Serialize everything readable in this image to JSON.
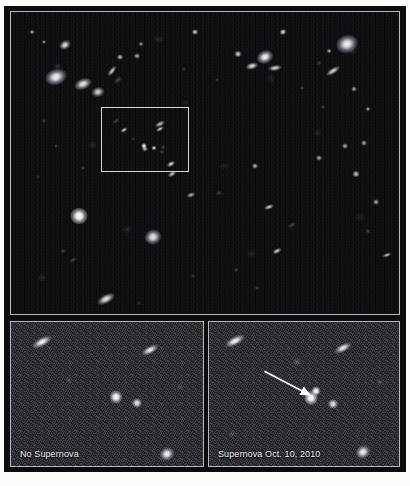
{
  "figure": {
    "kind": "astronomical-image-plate",
    "background_color": "#fbfbf9",
    "frame_color": "#0c0c0e",
    "panel_border_color": "#b9b9b4",
    "sky_color": "#0a0a0c",
    "zoom_sky_color": "#1b1b20",
    "star_color": "#ffffff"
  },
  "panels": {
    "wide_field": {
      "name": "wide-field-deep-sky-image",
      "caption": "",
      "roi_box": {
        "x": 97,
        "y": 107,
        "width": 88,
        "height": 65,
        "color": "#d8d8d2"
      }
    },
    "before": {
      "name": "before-cutout",
      "caption": "No Supernova"
    },
    "after": {
      "name": "after-cutout",
      "caption": "Supernova Oct. 10, 2010",
      "arrow": {
        "name": "supernova-pointer-arrow",
        "color": "#ffffff",
        "from_x": 56,
        "from_y": 50,
        "to_x": 102,
        "to_y": 74
      }
    }
  },
  "chart_data": {
    "type": "scatter",
    "title": "",
    "xlabel": "",
    "ylabel": "",
    "note": "Hubble deep-field galaxy cluster with supernova before/after cut-outs. Coordinates are panel-relative percentages; size in px; kind describes morphology.",
    "wide_field_objects": [
      {
        "x": 14.0,
        "y": 11.0,
        "w": 12,
        "h": 9,
        "kind": "blob",
        "angle": -30,
        "bright": 0.9
      },
      {
        "x": 11.5,
        "y": 21.5,
        "w": 22,
        "h": 16,
        "kind": "blob",
        "angle": -18,
        "bright": 1.0
      },
      {
        "x": 18.5,
        "y": 24.0,
        "w": 18,
        "h": 11,
        "kind": "blob",
        "angle": -22,
        "bright": 0.95
      },
      {
        "x": 22.5,
        "y": 26.5,
        "w": 13,
        "h": 10,
        "kind": "blob",
        "angle": -12,
        "bright": 0.85
      },
      {
        "x": 26.0,
        "y": 19.5,
        "w": 13,
        "h": 5,
        "kind": "blob",
        "angle": -52,
        "bright": 0.8
      },
      {
        "x": 27.5,
        "y": 22.5,
        "w": 9,
        "h": 5,
        "kind": "faint",
        "angle": -40,
        "bright": 0.55
      },
      {
        "x": 28.0,
        "y": 15.0,
        "w": 6,
        "h": 5,
        "kind": "point",
        "angle": 0,
        "bright": 0.7
      },
      {
        "x": 5.5,
        "y": 6.5,
        "w": 5,
        "h": 4,
        "kind": "point",
        "angle": 0,
        "bright": 0.6
      },
      {
        "x": 8.5,
        "y": 10.0,
        "w": 4,
        "h": 4,
        "kind": "point",
        "angle": 0,
        "bright": 0.5
      },
      {
        "x": 47.5,
        "y": 6.5,
        "w": 6,
        "h": 5,
        "kind": "point",
        "angle": 0,
        "bright": 0.75
      },
      {
        "x": 32.5,
        "y": 14.5,
        "w": 6,
        "h": 5,
        "kind": "point",
        "angle": 0,
        "bright": 0.6
      },
      {
        "x": 33.5,
        "y": 10.5,
        "w": 5,
        "h": 4,
        "kind": "point",
        "angle": 0,
        "bright": 0.5
      },
      {
        "x": 70.0,
        "y": 6.5,
        "w": 7,
        "h": 5,
        "kind": "point",
        "angle": -25,
        "bright": 0.8
      },
      {
        "x": 58.5,
        "y": 14.0,
        "w": 7,
        "h": 6,
        "kind": "point",
        "angle": 0,
        "bright": 0.75
      },
      {
        "x": 65.5,
        "y": 15.0,
        "w": 17,
        "h": 13,
        "kind": "blob",
        "angle": -25,
        "bright": 1.0
      },
      {
        "x": 62.0,
        "y": 18.0,
        "w": 13,
        "h": 7,
        "kind": "blob",
        "angle": -15,
        "bright": 0.9
      },
      {
        "x": 68.0,
        "y": 18.5,
        "w": 14,
        "h": 6,
        "kind": "blob",
        "angle": -8,
        "bright": 0.85
      },
      {
        "x": 86.5,
        "y": 10.5,
        "w": 22,
        "h": 18,
        "kind": "blob",
        "angle": -18,
        "bright": 1.0
      },
      {
        "x": 82.0,
        "y": 13.0,
        "w": 5,
        "h": 4,
        "kind": "point",
        "angle": 0,
        "bright": 0.6
      },
      {
        "x": 83.0,
        "y": 19.5,
        "w": 16,
        "h": 6,
        "kind": "blob",
        "angle": -32,
        "bright": 0.85
      },
      {
        "x": 88.5,
        "y": 25.5,
        "w": 5,
        "h": 5,
        "kind": "point",
        "angle": 0,
        "bright": 0.6
      },
      {
        "x": 79.5,
        "y": 17.0,
        "w": 5,
        "h": 4,
        "kind": "faint",
        "angle": 0,
        "bright": 0.45
      },
      {
        "x": 75.0,
        "y": 25.0,
        "w": 5,
        "h": 4,
        "kind": "faint",
        "angle": 0,
        "bright": 0.45
      },
      {
        "x": 92.0,
        "y": 32.0,
        "w": 5,
        "h": 4,
        "kind": "point",
        "angle": 0,
        "bright": 0.55
      },
      {
        "x": 27.0,
        "y": 36.0,
        "w": 7,
        "h": 4,
        "kind": "faint",
        "angle": -35,
        "bright": 0.5
      },
      {
        "x": 38.5,
        "y": 37.0,
        "w": 11,
        "h": 5,
        "kind": "blob",
        "angle": -28,
        "bright": 0.75
      },
      {
        "x": 34.5,
        "y": 45.5,
        "w": 6,
        "h": 4,
        "kind": "point",
        "angle": 0,
        "bright": 0.65
      },
      {
        "x": 39.0,
        "y": 46.5,
        "w": 5,
        "h": 4,
        "kind": "faint",
        "angle": 0,
        "bright": 0.5
      },
      {
        "x": 41.5,
        "y": 53.5,
        "w": 9,
        "h": 5,
        "kind": "blob",
        "angle": -30,
        "bright": 0.8
      },
      {
        "x": 17.5,
        "y": 67.5,
        "w": 17,
        "h": 16,
        "kind": "point",
        "angle": 0,
        "bright": 1.0
      },
      {
        "x": 36.5,
        "y": 74.5,
        "w": 17,
        "h": 15,
        "kind": "blob",
        "angle": -18,
        "bright": 0.95
      },
      {
        "x": 13.5,
        "y": 79.0,
        "w": 5,
        "h": 4,
        "kind": "faint",
        "angle": 0,
        "bright": 0.5
      },
      {
        "x": 16.0,
        "y": 82.0,
        "w": 7,
        "h": 4,
        "kind": "faint",
        "angle": -28,
        "bright": 0.55
      },
      {
        "x": 18.5,
        "y": 51.5,
        "w": 5,
        "h": 4,
        "kind": "faint",
        "angle": 0,
        "bright": 0.45
      },
      {
        "x": 24.5,
        "y": 95.0,
        "w": 19,
        "h": 9,
        "kind": "blob",
        "angle": -28,
        "bright": 0.95
      },
      {
        "x": 46.5,
        "y": 60.5,
        "w": 9,
        "h": 5,
        "kind": "blob",
        "angle": -18,
        "bright": 0.7
      },
      {
        "x": 53.5,
        "y": 60.0,
        "w": 6,
        "h": 4,
        "kind": "faint",
        "angle": 0,
        "bright": 0.5
      },
      {
        "x": 63.0,
        "y": 51.0,
        "w": 6,
        "h": 5,
        "kind": "point",
        "angle": 0,
        "bright": 0.65
      },
      {
        "x": 66.5,
        "y": 64.5,
        "w": 10,
        "h": 5,
        "kind": "blob",
        "angle": -20,
        "bright": 0.8
      },
      {
        "x": 68.5,
        "y": 79.0,
        "w": 10,
        "h": 5,
        "kind": "blob",
        "angle": -28,
        "bright": 0.8
      },
      {
        "x": 72.5,
        "y": 70.5,
        "w": 8,
        "h": 4,
        "kind": "faint",
        "angle": -30,
        "bright": 0.55
      },
      {
        "x": 79.5,
        "y": 48.5,
        "w": 6,
        "h": 5,
        "kind": "point",
        "angle": 0,
        "bright": 0.6
      },
      {
        "x": 86.0,
        "y": 44.5,
        "w": 6,
        "h": 5,
        "kind": "point",
        "angle": 0,
        "bright": 0.6
      },
      {
        "x": 91.0,
        "y": 43.5,
        "w": 6,
        "h": 5,
        "kind": "point",
        "angle": 0,
        "bright": 0.6
      },
      {
        "x": 89.0,
        "y": 53.5,
        "w": 7,
        "h": 6,
        "kind": "point",
        "angle": 0,
        "bright": 0.7
      },
      {
        "x": 94.0,
        "y": 63.0,
        "w": 6,
        "h": 5,
        "kind": "point",
        "angle": 0,
        "bright": 0.6
      },
      {
        "x": 92.0,
        "y": 72.5,
        "w": 5,
        "h": 4,
        "kind": "faint",
        "angle": 0,
        "bright": 0.5
      },
      {
        "x": 97.0,
        "y": 80.5,
        "w": 9,
        "h": 4,
        "kind": "blob",
        "angle": -20,
        "bright": 0.75
      },
      {
        "x": 80.5,
        "y": 31.5,
        "w": 5,
        "h": 4,
        "kind": "faint",
        "angle": 0,
        "bright": 0.45
      },
      {
        "x": 58.0,
        "y": 85.5,
        "w": 5,
        "h": 4,
        "kind": "faint",
        "angle": 0,
        "bright": 0.45
      },
      {
        "x": 63.5,
        "y": 91.5,
        "w": 5,
        "h": 4,
        "kind": "faint",
        "angle": 0,
        "bright": 0.45
      },
      {
        "x": 47.0,
        "y": 87.5,
        "w": 4,
        "h": 4,
        "kind": "faint",
        "angle": 0,
        "bright": 0.4
      },
      {
        "x": 33.0,
        "y": 96.5,
        "w": 4,
        "h": 4,
        "kind": "faint",
        "angle": 0,
        "bright": 0.4
      },
      {
        "x": 11.5,
        "y": 44.5,
        "w": 4,
        "h": 4,
        "kind": "faint",
        "angle": 0,
        "bright": 0.45
      },
      {
        "x": 7.0,
        "y": 54.5,
        "w": 4,
        "h": 4,
        "kind": "faint",
        "angle": 0,
        "bright": 0.4
      },
      {
        "x": 8.5,
        "y": 36.0,
        "w": 5,
        "h": 4,
        "kind": "faint",
        "angle": 0,
        "bright": 0.45
      },
      {
        "x": 53.0,
        "y": 22.5,
        "w": 4,
        "h": 4,
        "kind": "faint",
        "angle": 0,
        "bright": 0.4
      },
      {
        "x": 44.5,
        "y": 19.0,
        "w": 4,
        "h": 4,
        "kind": "faint",
        "angle": 0,
        "bright": 0.4
      }
    ],
    "roi_objects": [
      {
        "x": 26.0,
        "y": 35.0,
        "w": 8,
        "h": 4,
        "kind": "blob",
        "angle": -30,
        "bright": 0.8
      },
      {
        "x": 66.5,
        "y": 34.0,
        "w": 9,
        "h": 4,
        "kind": "blob",
        "angle": -28,
        "bright": 0.8
      },
      {
        "x": 48.5,
        "y": 60.5,
        "w": 5,
        "h": 6,
        "kind": "point",
        "angle": 0,
        "bright": 0.95
      },
      {
        "x": 60.5,
        "y": 63.5,
        "w": 5,
        "h": 4,
        "kind": "point",
        "angle": 0,
        "bright": 0.8
      },
      {
        "x": 71.0,
        "y": 62.0,
        "w": 4,
        "h": 4,
        "kind": "faint",
        "angle": 0,
        "bright": 0.55
      },
      {
        "x": 79.0,
        "y": 88.0,
        "w": 9,
        "h": 5,
        "kind": "blob",
        "angle": -30,
        "bright": 0.85
      },
      {
        "x": 36.0,
        "y": 49.0,
        "w": 4,
        "h": 3,
        "kind": "faint",
        "angle": 0,
        "bright": 0.45
      }
    ],
    "before_objects": [
      {
        "x": 16.0,
        "y": 14.0,
        "w": 22,
        "h": 9,
        "kind": "blob",
        "angle": -28,
        "bright": 1.0
      },
      {
        "x": 72.5,
        "y": 19.5,
        "w": 19,
        "h": 8,
        "kind": "blob",
        "angle": -28,
        "bright": 0.95
      },
      {
        "x": 54.5,
        "y": 52.0,
        "w": 12,
        "h": 13,
        "kind": "point",
        "angle": 0,
        "bright": 1.0
      },
      {
        "x": 65.5,
        "y": 56.5,
        "w": 10,
        "h": 9,
        "kind": "point",
        "angle": 0,
        "bright": 0.85
      },
      {
        "x": 81.5,
        "y": 91.5,
        "w": 15,
        "h": 13,
        "kind": "blob",
        "angle": -30,
        "bright": 1.0
      },
      {
        "x": 30.0,
        "y": 40.0,
        "w": 7,
        "h": 6,
        "kind": "faint",
        "angle": 0,
        "bright": 0.4
      },
      {
        "x": 88.0,
        "y": 45.0,
        "w": 7,
        "h": 6,
        "kind": "faint",
        "angle": 0,
        "bright": 0.4
      }
    ],
    "after_objects": [
      {
        "x": 13.5,
        "y": 13.5,
        "w": 22,
        "h": 9,
        "kind": "blob",
        "angle": -28,
        "bright": 1.0
      },
      {
        "x": 70.5,
        "y": 18.0,
        "w": 19,
        "h": 8,
        "kind": "blob",
        "angle": -28,
        "bright": 0.95
      },
      {
        "x": 46.5,
        "y": 28.0,
        "w": 9,
        "h": 8,
        "kind": "faint",
        "angle": 0,
        "bright": 0.5
      },
      {
        "x": 53.5,
        "y": 52.5,
        "w": 13,
        "h": 14,
        "kind": "point",
        "angle": 0,
        "bright": 1.0
      },
      {
        "x": 56.5,
        "y": 48.0,
        "w": 9,
        "h": 9,
        "kind": "point",
        "angle": 0,
        "bright": 1.0
      },
      {
        "x": 65.5,
        "y": 57.0,
        "w": 10,
        "h": 9,
        "kind": "point",
        "angle": 0,
        "bright": 0.85
      },
      {
        "x": 81.0,
        "y": 90.5,
        "w": 15,
        "h": 13,
        "kind": "blob",
        "angle": -30,
        "bright": 1.0
      },
      {
        "x": 12.0,
        "y": 78.0,
        "w": 7,
        "h": 6,
        "kind": "faint",
        "angle": 0,
        "bright": 0.4
      },
      {
        "x": 90.0,
        "y": 42.0,
        "w": 7,
        "h": 6,
        "kind": "faint",
        "angle": 0,
        "bright": 0.4
      }
    ]
  }
}
